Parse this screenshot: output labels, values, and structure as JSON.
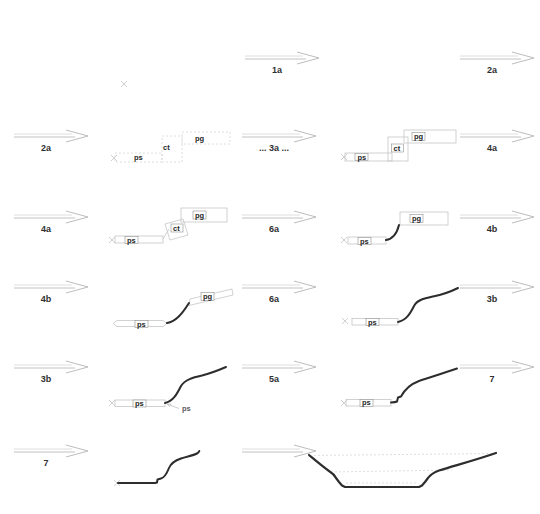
{
  "diagram": {
    "description_visible_text_only": "",
    "arrows": [
      {
        "id": "r1-mid",
        "label": "1a"
      },
      {
        "id": "r1-right",
        "label": "2a"
      },
      {
        "id": "r2-left",
        "label": "2a"
      },
      {
        "id": "r2-mid",
        "label": "... 3a ..."
      },
      {
        "id": "r2-right",
        "label": "4a"
      },
      {
        "id": "r3-left",
        "label": "4a"
      },
      {
        "id": "r3-mid",
        "label": "6a"
      },
      {
        "id": "r3-right",
        "label": "4b"
      },
      {
        "id": "r4-left",
        "label": "4b"
      },
      {
        "id": "r4-mid",
        "label": "6a"
      },
      {
        "id": "r4-right",
        "label": "3b"
      },
      {
        "id": "r5-left",
        "label": "3b"
      },
      {
        "id": "r5-mid",
        "label": "5a"
      },
      {
        "id": "r5-right",
        "label": "7"
      },
      {
        "id": "r6-left",
        "label": "7"
      },
      {
        "id": "r6-mid",
        "label": ""
      }
    ],
    "part_labels": {
      "ps": "ps",
      "ct": "ct",
      "pg": "pg"
    },
    "annotation": {
      "ps_pointer": "ps"
    },
    "colors": {
      "profile_stroke": "#2d2d2d",
      "construction_stroke": "#c6c6c6",
      "arrow_stroke": "#c2c2c2",
      "label_text": "#1f1f1f",
      "background": "#ffffff"
    }
  }
}
